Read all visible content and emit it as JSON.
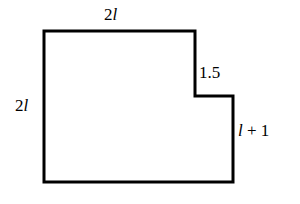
{
  "figure": {
    "background_color": "#ffffff",
    "stroke_color": "#000000",
    "stroke_width": 3,
    "labels": {
      "top": {
        "coefficient": "2",
        "variable": "l"
      },
      "left": {
        "coefficient": "2",
        "variable": "l"
      },
      "notch": {
        "value": "1.5"
      },
      "right": {
        "variable": "l",
        "operator": "+",
        "constant": "1"
      }
    }
  },
  "chart_data": {
    "type": "diagram",
    "subtype": "polygon",
    "title": "",
    "units": "",
    "vertices": [
      {
        "x": 44,
        "y": 31
      },
      {
        "x": 195,
        "y": 31
      },
      {
        "x": 195,
        "y": 96
      },
      {
        "x": 233,
        "y": 96
      },
      {
        "x": 233,
        "y": 182
      },
      {
        "x": 44,
        "y": 182
      }
    ],
    "edges": [
      {
        "from": 0,
        "to": 1,
        "orientation": "horizontal",
        "position": "top",
        "label": "2l"
      },
      {
        "from": 1,
        "to": 2,
        "orientation": "vertical",
        "position": "notch-vertical",
        "label": "1.5"
      },
      {
        "from": 2,
        "to": 3,
        "orientation": "horizontal",
        "position": "notch-horizontal",
        "label": ""
      },
      {
        "from": 3,
        "to": 4,
        "orientation": "vertical",
        "position": "right-lower",
        "label": "l + 1"
      },
      {
        "from": 4,
        "to": 5,
        "orientation": "horizontal",
        "position": "bottom",
        "label": ""
      },
      {
        "from": 5,
        "to": 0,
        "orientation": "vertical",
        "position": "left",
        "label": "2l"
      }
    ],
    "labeled_dimensions": [
      {
        "name": "top-width",
        "text": "2l"
      },
      {
        "name": "left-height",
        "text": "2l"
      },
      {
        "name": "notch-height",
        "text": "1.5"
      },
      {
        "name": "right-height",
        "text": "l + 1"
      }
    ]
  }
}
